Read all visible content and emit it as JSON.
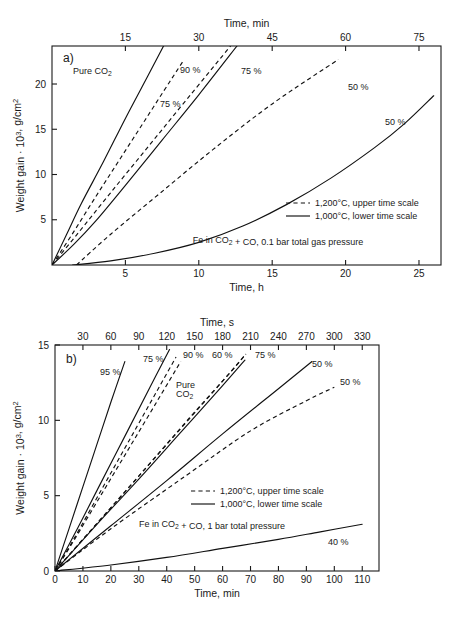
{
  "figure": {
    "background": "#ffffff",
    "ink_color": "#1a1a1a",
    "panels": [
      "a)",
      "b)"
    ]
  },
  "chart_data": [
    {
      "type": "line",
      "panel": "a)",
      "title": "",
      "xlabel": "Time, h",
      "xlabel_top": "Time, min",
      "ylabel": "Weight gain · 10³, g/cm²",
      "xlim": [
        0,
        26.5
      ],
      "xlim_top": [
        0,
        79.5
      ],
      "ylim": [
        0,
        24.2
      ],
      "xticks": [
        5,
        10,
        15,
        20,
        25
      ],
      "xticks_top": [
        15,
        30,
        45,
        60,
        75
      ],
      "yticks": [
        5,
        10,
        15,
        20
      ],
      "grid": false,
      "legend_position": "lower-right",
      "legend": [
        {
          "style": "dashed",
          "label": "1,200°C, upper time scale"
        },
        {
          "style": "solid",
          "label": "1,000°C, lower time scale"
        }
      ],
      "annotation": "Fe in CO₂ + CO, 0.1 bar total gas pressure",
      "series": [
        {
          "name": "Pure CO2",
          "label": "Pure CO₂",
          "style": "solid",
          "scale": "lower",
          "points": [
            [
              0.0,
              0.0
            ],
            [
              1.0,
              3.4
            ],
            [
              2.0,
              6.8
            ],
            [
              3.5,
              11.4
            ],
            [
              5.0,
              16.2
            ],
            [
              6.5,
              20.8
            ],
            [
              7.6,
              24.2
            ]
          ]
        },
        {
          "name": "90 percent 1200C",
          "label": "90 %",
          "style": "dashed",
          "scale": "upper",
          "points": [
            [
              0.0,
              0.0
            ],
            [
              4.0,
              3.3
            ],
            [
              9.0,
              7.6
            ],
            [
              14.0,
              11.8
            ],
            [
              19.0,
              16.0
            ],
            [
              24.0,
              20.2
            ],
            [
              27.0,
              22.7
            ]
          ]
        },
        {
          "name": "75 percent 1000C",
          "label": "75 %",
          "style": "solid",
          "scale": "lower",
          "points": [
            [
              0.0,
              0.0
            ],
            [
              1.5,
              2.3
            ],
            [
              3.0,
              4.9
            ],
            [
              5.0,
              8.8
            ],
            [
              7.5,
              13.8
            ],
            [
              10.0,
              18.8
            ],
            [
              12.6,
              24.2
            ]
          ]
        },
        {
          "name": "75 percent 1200C",
          "label": "75 %",
          "style": "dashed",
          "scale": "upper",
          "points": [
            [
              0.0,
              0.0
            ],
            [
              5.0,
              3.3
            ],
            [
              12.0,
              8.0
            ],
            [
              20.0,
              13.3
            ],
            [
              28.0,
              18.6
            ],
            [
              36.5,
              24.2
            ]
          ]
        },
        {
          "name": "50 percent 1200C",
          "label": "50 %",
          "style": "dashed",
          "scale": "upper",
          "points": [
            [
              5.0,
              0.0
            ],
            [
              12.0,
              3.4
            ],
            [
              22.0,
              7.9
            ],
            [
              33.0,
              12.8
            ],
            [
              45.0,
              17.8
            ],
            [
              58.5,
              22.7
            ]
          ]
        },
        {
          "name": "50 percent 1000C",
          "label": "50 %",
          "style": "solid",
          "scale": "lower",
          "points": [
            [
              1.4,
              0.0
            ],
            [
              4.0,
              0.45
            ],
            [
              7.0,
              1.3
            ],
            [
              10.0,
              2.5
            ],
            [
              13.0,
              4.3
            ],
            [
              16.0,
              6.7
            ],
            [
              19.0,
              9.6
            ],
            [
              22.0,
              13.0
            ],
            [
              24.0,
              15.6
            ],
            [
              26.0,
              18.7
            ]
          ]
        }
      ]
    },
    {
      "type": "line",
      "panel": "b)",
      "title": "",
      "xlabel": "Time, min",
      "xlabel_top": "Time, s",
      "ylabel": "Weight gain · 10³, g/cm²",
      "xlim": [
        0,
        116
      ],
      "xlim_top": [
        0,
        348
      ],
      "ylim": [
        0,
        15
      ],
      "xticks": [
        0,
        10,
        20,
        30,
        40,
        50,
        60,
        70,
        80,
        90,
        100,
        110
      ],
      "xticks_top": [
        30,
        60,
        90,
        120,
        150,
        180,
        210,
        240,
        270,
        300,
        330
      ],
      "yticks": [
        0,
        5,
        10,
        15
      ],
      "grid": false,
      "legend_position": "center-right",
      "legend": [
        {
          "style": "dashed",
          "label": "1,200°C, upper time scale"
        },
        {
          "style": "solid",
          "label": "1,000°C, lower time scale"
        }
      ],
      "annotation": "Fe in CO₂ + CO, 1 bar total pressure",
      "series": [
        {
          "name": "95 percent 1000C",
          "label": "95 %",
          "style": "solid",
          "scale": "lower",
          "points": [
            [
              0.0,
              0.0
            ],
            [
              5.0,
              2.8
            ],
            [
              10.0,
              5.6
            ],
            [
              15.0,
              8.4
            ],
            [
              20.0,
              11.2
            ],
            [
              25.0,
              13.9
            ]
          ]
        },
        {
          "name": "Pure CO2 1200C",
          "label": "Pure CO₂",
          "style": "dashed",
          "scale": "upper",
          "points": [
            [
              0.0,
              0.0
            ],
            [
              20.0,
              2.0
            ],
            [
              50.0,
              5.1
            ],
            [
              80.0,
              8.2
            ],
            [
              110.0,
              11.3
            ],
            [
              135.0,
              13.9
            ]
          ]
        },
        {
          "name": "90 percent 1200C",
          "label": "90 %",
          "style": "dashed",
          "scale": "upper",
          "points": [
            [
              0.0,
              0.0
            ],
            [
              20.0,
              2.1
            ],
            [
              50.0,
              5.4
            ],
            [
              80.0,
              8.7
            ],
            [
              110.0,
              12.0
            ],
            [
              130.0,
              14.2
            ]
          ]
        },
        {
          "name": "75 percent 1000C",
          "label": "75 %",
          "style": "solid",
          "scale": "lower",
          "points": [
            [
              0.0,
              0.0
            ],
            [
              8.0,
              2.8
            ],
            [
              16.0,
              5.7
            ],
            [
              26.0,
              9.3
            ],
            [
              34.0,
              12.2
            ],
            [
              41.0,
              14.7
            ]
          ]
        },
        {
          "name": "60 percent 1200C",
          "label": "60 %",
          "style": "dashed",
          "scale": "upper",
          "points": [
            [
              0.0,
              0.0
            ],
            [
              40.0,
              2.8
            ],
            [
              90.0,
              6.3
            ],
            [
              140.0,
              9.8
            ],
            [
              180.0,
              12.6
            ],
            [
              205.0,
              14.4
            ]
          ]
        },
        {
          "name": "75 percent 1200C",
          "label": "75 %",
          "style": "dashed",
          "scale": "upper",
          "points": [
            [
              0.0,
              0.0
            ],
            [
              40.0,
              2.8
            ],
            [
              90.0,
              6.3
            ],
            [
              145.0,
              10.2
            ],
            [
              190.0,
              13.3
            ],
            [
              205.0,
              14.4
            ]
          ]
        },
        {
          "name": "60 percent 1000C",
          "label": "",
          "style": "solid",
          "scale": "lower",
          "points": [
            [
              0.0,
              0.0
            ],
            [
              15.0,
              3.1
            ],
            [
              30.0,
              6.1
            ],
            [
              45.0,
              9.2
            ],
            [
              60.0,
              12.3
            ],
            [
              68.0,
              14.0
            ]
          ]
        },
        {
          "name": "50 percent 1000C",
          "label": "50 %",
          "style": "solid",
          "scale": "lower",
          "points": [
            [
              0.0,
              0.0
            ],
            [
              20.0,
              3.0
            ],
            [
              40.0,
              6.0
            ],
            [
              60.0,
              9.1
            ],
            [
              80.0,
              12.1
            ],
            [
              92.0,
              13.9
            ]
          ]
        },
        {
          "name": "50 percent 1200C",
          "label": "50 %",
          "style": "dashed",
          "scale": "upper",
          "points": [
            [
              0.0,
              0.0
            ],
            [
              60.0,
              2.8
            ],
            [
              140.0,
              6.3
            ],
            [
              210.0,
              9.3
            ],
            [
              270.0,
              11.3
            ],
            [
              300.0,
              12.2
            ]
          ]
        },
        {
          "name": "40 percent 1000C",
          "label": "40 %",
          "style": "solid",
          "scale": "lower",
          "points": [
            [
              0.0,
              0.0
            ],
            [
              20.0,
              0.4
            ],
            [
              40.0,
              0.9
            ],
            [
              60.0,
              1.5
            ],
            [
              80.0,
              2.1
            ],
            [
              95.0,
              2.6
            ],
            [
              110.0,
              3.1
            ]
          ]
        }
      ]
    }
  ]
}
